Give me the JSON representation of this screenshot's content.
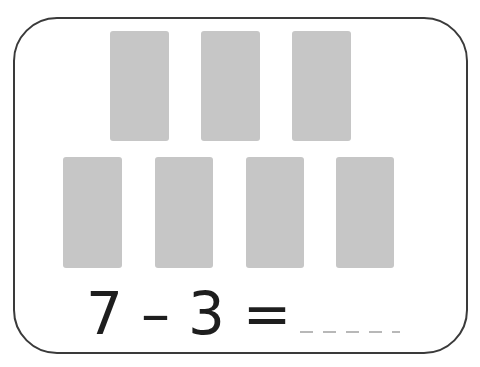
{
  "worksheet": {
    "top_row_blocks": 3,
    "bottom_row_blocks": 4,
    "total_blocks": 7,
    "block_color": "#c6c6c6",
    "equation": {
      "minuend": "7",
      "operator": "–",
      "subtrahend": "3",
      "equals": "=",
      "answer_placeholder": "_ _ _ _ _"
    }
  }
}
